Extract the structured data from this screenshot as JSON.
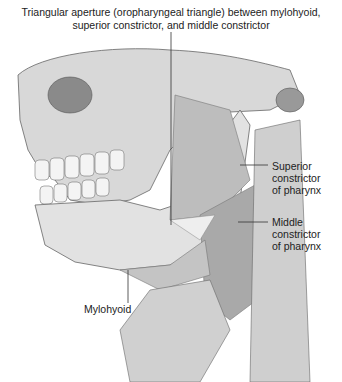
{
  "figure": {
    "title_line1": "Triangular aperture (oropharyngeal triangle) between mylohyoid,",
    "title_line2": "superior constrictor, and middle constrictor",
    "labels": {
      "superior": [
        "Superior",
        "constrictor",
        "of pharynx"
      ],
      "middle": [
        "Middle",
        "constrictor",
        "of pharynx"
      ],
      "mylohyoid": "Mylohyoid"
    }
  }
}
